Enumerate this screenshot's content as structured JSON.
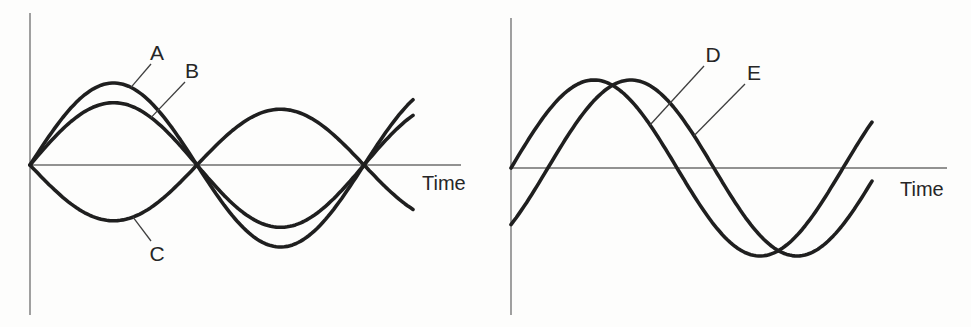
{
  "figure": {
    "background_color": "#fdfdfc",
    "ink_color": "#1f1f1f",
    "axis_color": "#6e6e6e"
  },
  "chart_data": [
    {
      "type": "line",
      "panel": "left",
      "title": "",
      "xlabel": "Time",
      "ylabel": "",
      "axis_numbers_shown": false,
      "grid": false,
      "cycles_shown": 1.15,
      "series": [
        {
          "name": "A",
          "amplitude_rel": 1.0,
          "phase_deg": 0,
          "frequency_rel": 1
        },
        {
          "name": "B",
          "amplitude_rel": 0.76,
          "phase_deg": 0,
          "frequency_rel": 1
        },
        {
          "name": "C",
          "amplitude_rel": 0.68,
          "phase_deg": 180,
          "frequency_rel": 1
        }
      ]
    },
    {
      "type": "line",
      "panel": "right",
      "title": "",
      "xlabel": "Time",
      "ylabel": "",
      "axis_numbers_shown": false,
      "grid": false,
      "cycles_shown": 1.09,
      "series": [
        {
          "name": "D",
          "amplitude_rel": 1.0,
          "phase_deg": 0,
          "frequency_rel": 1
        },
        {
          "name": "E",
          "amplitude_rel": 1.0,
          "phase_deg": -40,
          "frequency_rel": 1
        }
      ]
    }
  ]
}
